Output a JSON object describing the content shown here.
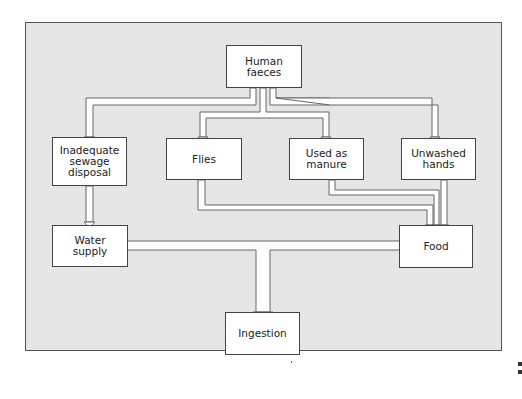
{
  "diagram": {
    "type": "flowchart",
    "nodes": [
      {
        "id": "human_faeces",
        "label": "Human faeces"
      },
      {
        "id": "sewage",
        "label": "Inadequate sewage disposal"
      },
      {
        "id": "flies",
        "label": "Flies"
      },
      {
        "id": "manure",
        "label": "Used as manure"
      },
      {
        "id": "hands",
        "label": "Unwashed hands"
      },
      {
        "id": "water",
        "label": "Water supply"
      },
      {
        "id": "food",
        "label": "Food"
      },
      {
        "id": "ingestion",
        "label": "Ingestion"
      }
    ],
    "edges": [
      {
        "from": "human_faeces",
        "to": "sewage"
      },
      {
        "from": "human_faeces",
        "to": "flies"
      },
      {
        "from": "human_faeces",
        "to": "manure"
      },
      {
        "from": "human_faeces",
        "to": "hands"
      },
      {
        "from": "sewage",
        "to": "water"
      },
      {
        "from": "flies",
        "to": "food"
      },
      {
        "from": "manure",
        "to": "food"
      },
      {
        "from": "hands",
        "to": "food"
      },
      {
        "from": "water",
        "to": "ingestion"
      },
      {
        "from": "food",
        "to": "ingestion"
      }
    ]
  },
  "labels": {
    "human_faeces_1": "Human",
    "human_faeces_2": "faeces",
    "sewage_1": "Inadequate",
    "sewage_2": "sewage",
    "sewage_3": "disposal",
    "flies": "Flies",
    "manure_1": "Used as",
    "manure_2": "manure",
    "hands_1": "Unwashed",
    "hands_2": "hands",
    "water_1": "Water",
    "water_2": "supply",
    "food": "Food",
    "ingestion": "Ingestion"
  },
  "colors": {
    "panel": "#e6e6e6",
    "box": "#ffffff",
    "line": "#555555"
  }
}
